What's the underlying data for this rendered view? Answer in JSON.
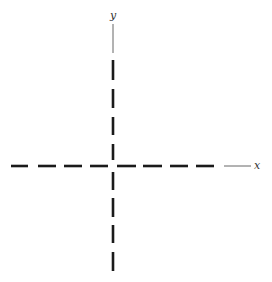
{
  "diagram": {
    "type": "coordinate-axes",
    "colors": {
      "dash": "#1a1a1a",
      "thin_line": "#666666",
      "label": "#333333",
      "background": "#ffffff"
    },
    "x_axis": {
      "label": "x",
      "style": "dashed",
      "extension_style": "thin-solid"
    },
    "y_axis": {
      "label": "y",
      "style": "dashed",
      "extension_style": "thin-solid"
    }
  }
}
